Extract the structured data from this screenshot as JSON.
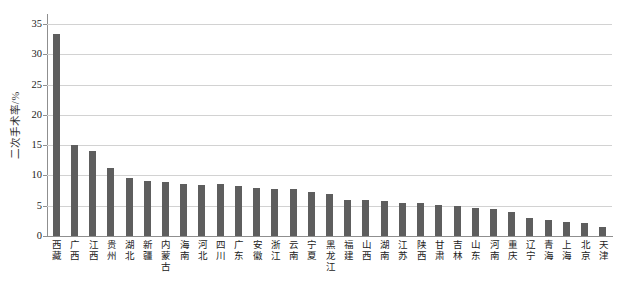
{
  "chart_data": {
    "type": "bar",
    "title": "",
    "xlabel": "",
    "ylabel": "二次手术率/%",
    "ylim": [
      0,
      35
    ],
    "yticks": [
      0,
      5,
      10,
      15,
      20,
      25,
      30,
      35
    ],
    "grid": true,
    "legend": "none",
    "bar_color": "#5e5e5e",
    "gridline_color": "#d2d2d2",
    "axis_color": "#8f8f8f",
    "categories": [
      "西藏",
      "广西",
      "江西",
      "贵州",
      "湖北",
      "新疆",
      "内蒙古",
      "海南",
      "河北",
      "四川",
      "广东",
      "安徽",
      "浙江",
      "云南",
      "宁夏",
      "黑龙江",
      "福建",
      "山西",
      "湖南",
      "江苏",
      "陕西",
      "甘肃",
      "吉林",
      "山东",
      "河南",
      "重庆",
      "辽宁",
      "青海",
      "上海",
      "北京",
      "天津"
    ],
    "values": [
      33.4,
      15.0,
      14.1,
      11.2,
      9.5,
      9.1,
      8.9,
      8.6,
      8.5,
      8.6,
      8.3,
      7.9,
      7.8,
      7.7,
      7.3,
      6.9,
      6.0,
      5.9,
      5.7,
      5.5,
      5.5,
      5.1,
      5.0,
      4.6,
      4.4,
      3.9,
      3.0,
      2.7,
      2.3,
      2.2,
      1.5
    ]
  }
}
